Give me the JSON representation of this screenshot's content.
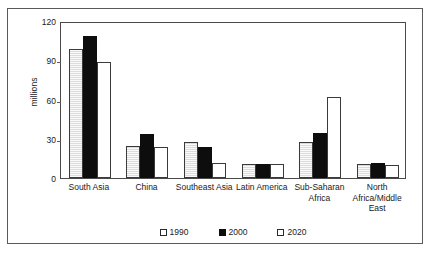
{
  "chart_data": {
    "type": "bar",
    "title": "",
    "xlabel": "",
    "ylabel": "millions",
    "ylim": [
      0,
      120
    ],
    "yticks": [
      0,
      30,
      60,
      90,
      120
    ],
    "grid": false,
    "legend_position": "bottom",
    "categories": [
      "South Asia",
      "China",
      "Southeast Asia",
      "Latin America",
      "Sub-Saharan Africa",
      "North Africa/Middle East"
    ],
    "series": [
      {
        "name": "1990",
        "color": "#dcdcdc",
        "values": [
          100,
          25,
          28,
          11,
          28,
          11
        ]
      },
      {
        "name": "2000",
        "color": "#0d0d0d",
        "values": [
          110,
          34,
          24,
          11,
          35,
          12
        ]
      },
      {
        "name": "2020",
        "color": "#ffffff",
        "values": [
          90,
          24,
          12,
          11,
          63,
          10
        ]
      }
    ]
  },
  "axis": {
    "ytick_labels": [
      "0",
      "30",
      "60",
      "90",
      "120"
    ],
    "y_axis_title": "millions"
  },
  "legend": {
    "items": [
      {
        "label": "1990",
        "swatch": "light-gray-square"
      },
      {
        "label": "2000",
        "swatch": "black-square"
      },
      {
        "label": "2020",
        "swatch": "white-square"
      }
    ]
  }
}
